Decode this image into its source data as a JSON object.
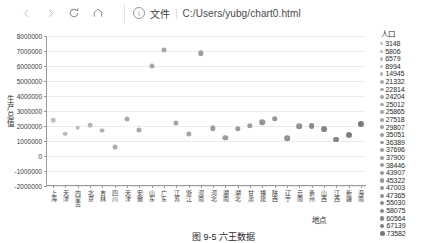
{
  "browser": {
    "back_icon": "arrow-left-icon",
    "forward_icon": "arrow-right-icon",
    "reload_icon": "reload-icon",
    "home_icon": "home-icon",
    "info_icon_glyph": "i",
    "file_label": "文件",
    "separator": "|",
    "url": "C:/Users/yubg/chart0.html"
  },
  "caption": "图 9-5  六王数据",
  "chart_data": {
    "type": "scatter",
    "title": "",
    "xlabel": "地点",
    "ylabel": "生产总值",
    "ylim": [
      -2000000,
      8000000
    ],
    "yticks": [
      8000000,
      7000000,
      6000000,
      5000000,
      4000000,
      3000000,
      2000000,
      1000000,
      0,
      -1000000,
      -2000000
    ],
    "ytick_labels": [
      "8000000",
      "7000000",
      "6000000",
      "5000000",
      "4000000",
      "3000000",
      "2000000",
      "1000000",
      "0",
      "-1000000",
      "-2000000"
    ],
    "grid": true,
    "legend_title": "人口",
    "legend_position": "right",
    "legend_values": [
      3148,
      5806,
      6579,
      8994,
      14945,
      21332,
      22814,
      24204,
      25012,
      25865,
      27518,
      29807,
      35051,
      36389,
      37696,
      37900,
      38446,
      43907,
      45322,
      47003,
      47365,
      55030,
      58075,
      60564,
      67139,
      73582
    ],
    "categories": [
      "上海",
      "天津",
      "内蒙古",
      "北京",
      "吉林",
      "四川",
      "天津",
      "安徽",
      "山东",
      "广东",
      "江苏",
      "浙江",
      "河南",
      "河北",
      "湖南",
      "湖北",
      "甘肃",
      "福建",
      "陕西",
      "辽宁",
      "云南",
      "贵州",
      "山西",
      "江西",
      "新疆",
      "海南"
    ],
    "points": [
      {
        "x": "上海",
        "y": 2400000,
        "population": 3148
      },
      {
        "x": "天津",
        "y": 1500000,
        "population": 5806
      },
      {
        "x": "内蒙古",
        "y": 1900000,
        "population": 6579
      },
      {
        "x": "北京",
        "y": 2050000,
        "population": 8994
      },
      {
        "x": "吉林",
        "y": 1700000,
        "population": 14945
      },
      {
        "x": "四川",
        "y": 600000,
        "population": 21332
      },
      {
        "x": "天津",
        "y": 2500000,
        "population": 22814
      },
      {
        "x": "安徽",
        "y": 1750000,
        "population": 24204
      },
      {
        "x": "山东",
        "y": 6000000,
        "population": 25012
      },
      {
        "x": "广东",
        "y": 7100000,
        "population": 25865
      },
      {
        "x": "江苏",
        "y": 2200000,
        "population": 27518
      },
      {
        "x": "浙江",
        "y": 1450000,
        "population": 29807
      },
      {
        "x": "河南",
        "y": 6850000,
        "population": 35051
      },
      {
        "x": "河北",
        "y": 1850000,
        "population": 36389
      },
      {
        "x": "湖南",
        "y": 1200000,
        "population": 37696
      },
      {
        "x": "湖北",
        "y": 1800000,
        "population": 37900
      },
      {
        "x": "甘肃",
        "y": 2000000,
        "population": 38446
      },
      {
        "x": "福建",
        "y": 2250000,
        "population": 43907
      },
      {
        "x": "陕西",
        "y": 2500000,
        "population": 45322
      },
      {
        "x": "辽宁",
        "y": 1200000,
        "population": 47003
      },
      {
        "x": "云南",
        "y": 2000000,
        "population": 47365
      },
      {
        "x": "贵州",
        "y": 2000000,
        "population": 55030
      },
      {
        "x": "山西",
        "y": 1800000,
        "population": 58075
      },
      {
        "x": "江西",
        "y": 1100000,
        "population": 60564
      },
      {
        "x": "新疆",
        "y": 1400000,
        "population": 67139
      },
      {
        "x": "海南",
        "y": 2150000,
        "population": 73582
      }
    ]
  }
}
